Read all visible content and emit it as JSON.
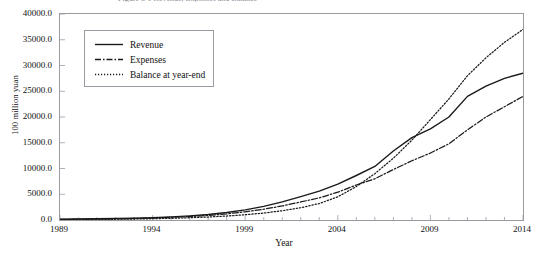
{
  "figure": {
    "title_fragment": "Figure 3-1 Revenue, Expenses and Balance",
    "background": "#ffffff",
    "frame_color": "#9a9aa2",
    "line_color": "#1a1a1a"
  },
  "legend": {
    "position": "upper-left-inside",
    "entries": [
      {
        "label": "Revenue",
        "style": "solid",
        "key": "revenue"
      },
      {
        "label": "Expenses",
        "style": "dash-dot",
        "key": "expenses"
      },
      {
        "label": "Balance at year-end",
        "style": "dotted",
        "key": "balance"
      }
    ]
  },
  "chart_data": {
    "type": "line",
    "title": "Figure 3-1 Revenue, Expenses and Balance",
    "xlabel": "Year",
    "ylabel": "100 million yuan",
    "xlim": [
      1989,
      2014
    ],
    "ylim": [
      0.0,
      40000.0
    ],
    "grid": false,
    "x_ticks": [
      1989,
      1994,
      1999,
      2004,
      2009,
      2014
    ],
    "x_tick_labels": [
      "1989",
      "1994",
      "1999",
      "2004",
      "2009",
      "2014"
    ],
    "x_minor_tick_step": 1,
    "y_ticks": [
      0.0,
      5000.0,
      10000.0,
      15000.0,
      20000.0,
      25000.0,
      30000.0,
      35000.0,
      40000.0
    ],
    "y_tick_labels": [
      "0.0",
      "5000.0",
      "10000.0",
      "15000.0",
      "20000.0",
      "25000.0",
      "30000.0",
      "35000.0",
      "40000.0"
    ],
    "legend_position": "upper left",
    "x": [
      1989,
      1990,
      1991,
      1992,
      1993,
      1994,
      1995,
      1996,
      1997,
      1998,
      1999,
      2000,
      2001,
      2002,
      2003,
      2004,
      2005,
      2006,
      2007,
      2008,
      2009,
      2010,
      2011,
      2012,
      2013,
      2014
    ],
    "series": [
      {
        "name": "Revenue",
        "style": "solid",
        "values": [
          150,
          190,
          230,
          280,
          350,
          450,
          600,
          800,
          1080,
          1460,
          1965,
          2645,
          3530,
          4530,
          5600,
          6970,
          8640,
          10400,
          13400,
          16000,
          17700,
          20000,
          24000,
          26000,
          27500,
          28500
        ]
      },
      {
        "name": "Expenses",
        "style": "dash-dot",
        "values": [
          130,
          165,
          200,
          245,
          305,
          390,
          510,
          670,
          890,
          1190,
          1590,
          2090,
          2730,
          3500,
          4300,
          5400,
          6800,
          8000,
          9800,
          11500,
          13000,
          14800,
          17500,
          20000,
          22000,
          24000
        ]
      },
      {
        "name": "Balance at year-end",
        "style": "dotted",
        "values": [
          60,
          85,
          110,
          145,
          190,
          250,
          330,
          440,
          580,
          770,
          1030,
          1350,
          1800,
          2380,
          3200,
          4500,
          6500,
          9000,
          12000,
          15500,
          19500,
          23500,
          28000,
          31500,
          34500,
          37000
        ]
      }
    ]
  }
}
